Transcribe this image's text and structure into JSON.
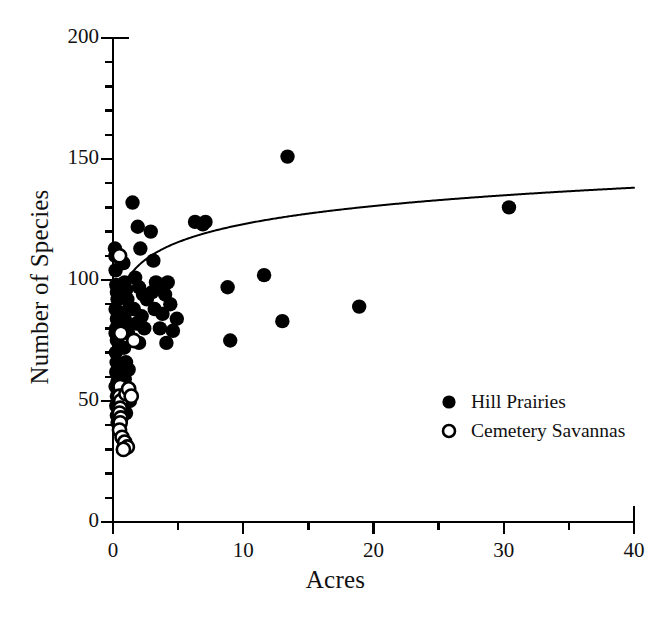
{
  "chart_data": {
    "type": "scatter",
    "title": "",
    "xlabel": "Acres",
    "ylabel": "Number of Species",
    "xlim": [
      0,
      40
    ],
    "ylim": [
      0,
      200
    ],
    "grid": false,
    "xticks": [
      0,
      10,
      20,
      30,
      40
    ],
    "yticks": [
      0,
      50,
      100,
      150,
      200
    ],
    "xtick_labels": [
      "0",
      "10",
      "20",
      "30",
      "40"
    ],
    "ytick_labels": [
      "0",
      "50",
      "100",
      "150",
      "200"
    ],
    "x_minor_step": 5,
    "y_minor_step": 10,
    "legend_position": "inside lower-right",
    "series": [
      {
        "name": "Hill Prairies",
        "marker": "filled-circle",
        "color": "#000000",
        "points": [
          [
            0.15,
            113
          ],
          [
            0.18,
            110
          ],
          [
            0.2,
            104
          ],
          [
            0.25,
            98
          ],
          [
            0.3,
            95
          ],
          [
            0.35,
            92
          ],
          [
            0.2,
            88
          ],
          [
            0.3,
            84
          ],
          [
            0.25,
            80
          ],
          [
            0.2,
            78
          ],
          [
            0.35,
            77
          ],
          [
            0.3,
            75
          ],
          [
            0.22,
            70
          ],
          [
            0.28,
            66
          ],
          [
            0.4,
            64
          ],
          [
            0.25,
            62
          ],
          [
            0.35,
            58
          ],
          [
            0.2,
            56
          ],
          [
            0.3,
            52
          ],
          [
            0.4,
            50
          ],
          [
            0.25,
            48
          ],
          [
            0.3,
            44
          ],
          [
            0.45,
            43
          ],
          [
            0.35,
            41
          ],
          [
            0.8,
            107
          ],
          [
            0.9,
            99
          ],
          [
            1.0,
            96
          ],
          [
            1.1,
            92
          ],
          [
            1.2,
            88
          ],
          [
            0.9,
            84
          ],
          [
            1.0,
            80
          ],
          [
            1.15,
            78
          ],
          [
            0.85,
            72
          ],
          [
            1.0,
            66
          ],
          [
            1.2,
            63
          ],
          [
            0.9,
            59
          ],
          [
            1.1,
            55
          ],
          [
            1.3,
            50
          ],
          [
            1.0,
            45
          ],
          [
            1.5,
            132
          ],
          [
            1.9,
            122
          ],
          [
            2.1,
            113
          ],
          [
            1.7,
            101
          ],
          [
            2.0,
            97
          ],
          [
            2.3,
            94
          ],
          [
            1.6,
            88
          ],
          [
            2.2,
            85
          ],
          [
            1.8,
            82
          ],
          [
            2.4,
            80
          ],
          [
            2.0,
            74
          ],
          [
            2.6,
            92
          ],
          [
            2.9,
            120
          ],
          [
            3.1,
            108
          ],
          [
            3.3,
            99
          ],
          [
            3.0,
            95
          ],
          [
            3.5,
            97
          ],
          [
            3.2,
            88
          ],
          [
            3.8,
            86
          ],
          [
            3.6,
            80
          ],
          [
            4.0,
            94
          ],
          [
            4.2,
            99
          ],
          [
            4.4,
            90
          ],
          [
            4.6,
            79
          ],
          [
            4.1,
            74
          ],
          [
            4.9,
            84
          ],
          [
            6.3,
            124
          ],
          [
            6.9,
            123
          ],
          [
            7.1,
            124
          ],
          [
            8.8,
            97
          ],
          [
            9.0,
            75
          ],
          [
            11.6,
            102
          ],
          [
            13.4,
            151
          ],
          [
            13.0,
            83
          ],
          [
            18.9,
            89
          ],
          [
            30.4,
            130
          ]
        ]
      },
      {
        "name": "Cemetery Savannas",
        "marker": "open-circle",
        "color": "#000000",
        "points": [
          [
            0.5,
            110
          ],
          [
            0.6,
            78
          ],
          [
            0.55,
            56
          ],
          [
            0.5,
            52
          ],
          [
            0.6,
            50
          ],
          [
            0.55,
            47
          ],
          [
            0.5,
            45
          ],
          [
            0.6,
            43
          ],
          [
            0.55,
            41
          ],
          [
            0.5,
            38
          ],
          [
            0.7,
            35
          ],
          [
            0.9,
            33
          ],
          [
            1.1,
            31
          ],
          [
            0.8,
            30
          ],
          [
            1.0,
            53
          ],
          [
            1.2,
            55
          ],
          [
            1.4,
            52
          ],
          [
            1.6,
            75
          ]
        ]
      }
    ],
    "fit_curve": {
      "name": "logarithmic fit",
      "equation_form": "y = a + b*ln(x + c)",
      "a": 97.5,
      "b": 11.0,
      "c": 0.205,
      "color": "#000000",
      "line_width": 2,
      "y_at_x0": 79,
      "y_at_x40": 122
    }
  },
  "legend": {
    "items": [
      {
        "label": "Hill Prairies",
        "marker": "filled-circle"
      },
      {
        "label": "Cemetery Savannas",
        "marker": "open-circle"
      }
    ]
  }
}
